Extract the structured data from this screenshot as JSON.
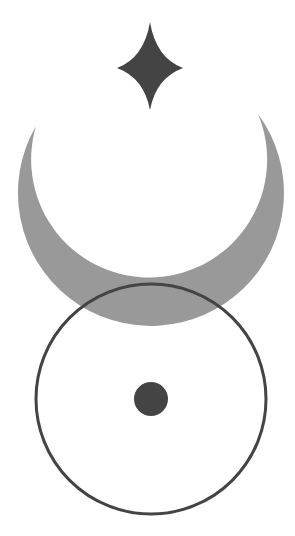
{
  "symbol": {
    "description": "Star above crescent above circle with center dot",
    "colors": {
      "background": "#ffffff",
      "star": "#444444",
      "crescent": "#999999",
      "circle_stroke": "#444444",
      "dot": "#444444"
    },
    "star": {
      "cx": 150,
      "top": 22,
      "bottom": 110,
      "left": 117,
      "right": 183
    },
    "crescent": {
      "left_tip": [
        36,
        126
      ],
      "right_tip": [
        258,
        114
      ],
      "bottom": 317
    },
    "circle": {
      "cx": 151,
      "cy": 399,
      "r": 116,
      "stroke_width": 3
    },
    "dot": {
      "cx": 151,
      "cy": 399,
      "r": 17
    }
  }
}
